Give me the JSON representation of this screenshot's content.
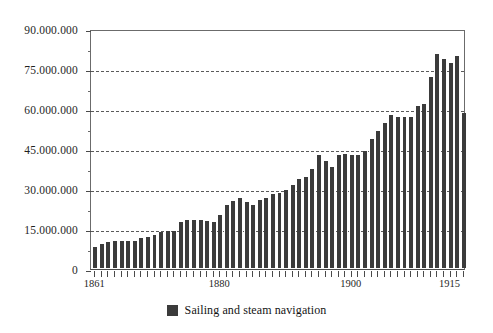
{
  "chart_data": {
    "type": "bar",
    "title": "",
    "subtitle": "",
    "xlabel": "",
    "ylabel": "",
    "ylim": [
      0,
      90000000
    ],
    "xlim": [
      1861,
      1915
    ],
    "grid": true,
    "legend_position": "bottom-center",
    "bar_color": "#3b3b3b",
    "y_tick_labels": [
      "0",
      "15.000.000",
      "30.000.000",
      "45.000.000",
      "60.000.000",
      "75.000.000",
      "90.000.000"
    ],
    "y_tick_values": [
      0,
      15000000,
      30000000,
      45000000,
      60000000,
      75000000,
      90000000
    ],
    "y_minor_tick_values": [
      7500000,
      22500000,
      37500000,
      52500000,
      67500000,
      82500000
    ],
    "x_tick_labels": [
      "1861",
      "1880",
      "1900",
      "1915"
    ],
    "x_tick_values": [
      1861,
      1880,
      1900,
      1915
    ],
    "series": [
      {
        "name": "Sailing and steam navigation",
        "categories": [
          1861,
          1862,
          1863,
          1864,
          1865,
          1866,
          1867,
          1868,
          1869,
          1870,
          1871,
          1872,
          1873,
          1874,
          1875,
          1876,
          1877,
          1878,
          1879,
          1880,
          1881,
          1882,
          1883,
          1884,
          1885,
          1886,
          1887,
          1888,
          1889,
          1890,
          1891,
          1892,
          1893,
          1894,
          1895,
          1896,
          1897,
          1898,
          1899,
          1900,
          1901,
          1902,
          1903,
          1904,
          1905,
          1906,
          1907,
          1908,
          1909,
          1910,
          1911,
          1912,
          1913,
          1914,
          1915
        ],
        "values": [
          7800000,
          9000000,
          9800000,
          10300000,
          10300000,
          10000000,
          10300000,
          11300000,
          11800000,
          12300000,
          13500000,
          13800000,
          13700000,
          17300000,
          18000000,
          18000000,
          18000000,
          17800000,
          17300000,
          19700000,
          23800000,
          25300000,
          26300000,
          24700000,
          23800000,
          25600000,
          26300000,
          27800000,
          28000000,
          29300000,
          31200000,
          33300000,
          34000000,
          37300000,
          42300000,
          40000000,
          37700000,
          42500000,
          42600000,
          42300000,
          42300000,
          44000000,
          48500000,
          51500000,
          54300000,
          57200000,
          56800000,
          56800000,
          56600000,
          60800000,
          61400000,
          71500000,
          80200000,
          78200000,
          77000000,
          79600000,
          58100000
        ]
      }
    ]
  },
  "legend": {
    "items": [
      {
        "label": "Sailing and steam navigation",
        "color": "#3b3b3b"
      }
    ]
  }
}
